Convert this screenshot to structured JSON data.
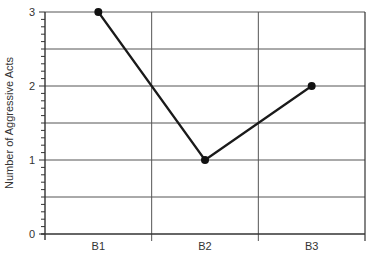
{
  "chart_data": {
    "type": "line",
    "title": "",
    "xlabel": "",
    "ylabel": "Number of Aggressive Acts",
    "categories": [
      "B1",
      "B2",
      "B3"
    ],
    "series": [
      {
        "name": "Aggressive Acts",
        "values": [
          3,
          1,
          2
        ]
      }
    ],
    "ylim": [
      0,
      3
    ],
    "yticks": [
      0,
      1,
      2,
      3
    ],
    "ytick_labels": [
      "0",
      "1",
      "2",
      "3"
    ],
    "y_minor_tick_step": 0.1,
    "y_grid_step": 0.5,
    "grid": true,
    "legend": null
  },
  "style": {
    "line_color": "#1a1a1a",
    "marker_color": "#111111",
    "grid_color": "#555555",
    "axis_color": "#333333"
  }
}
